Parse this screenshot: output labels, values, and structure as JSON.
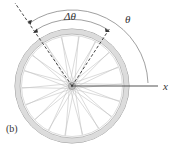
{
  "figure": {
    "panel_label": "(b)",
    "labels": {
      "delta_theta": "Δθ",
      "theta": "θ",
      "x_axis": "x"
    },
    "wheel": {
      "center": [
        72,
        86
      ],
      "outer_radius": 57,
      "inner_radius": 51,
      "spoke_count": 36,
      "rim_color": "#cfcfcf",
      "spoke_color": "#bdbdbd"
    },
    "angles_deg": {
      "reference_line_start": 124,
      "reference_line_end": 57
    },
    "colors": {
      "line": "#555555",
      "dashed": "#333333",
      "text": "#333333"
    }
  }
}
